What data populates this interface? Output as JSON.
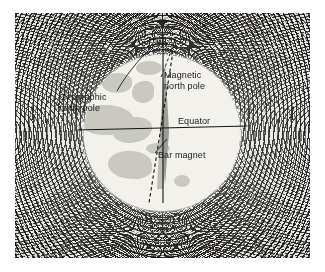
{
  "figure": {
    "kind": "photograph-diagram",
    "labels": {
      "geographic_north_pole": "Geographic\nnorth pole",
      "magnetic_north_pole": "Magnetic\nnorth pole",
      "equator": "Equator",
      "bar_magnet": "Bar magnet"
    },
    "colors": {
      "plate_background": "#e8e8e6",
      "filings": "#1a1715",
      "globe_fill": "#f2f1ec",
      "land_fill": "#c9c9c2",
      "line": "#1a1a1a",
      "bar_magnet": "#9a9a94",
      "page_background": "#ffffff"
    },
    "elements": {
      "rotation_axis": "solid vertical line through geographic poles",
      "magnetic_axis": "dashed line tilted from the rotation axis",
      "equator_line": "horizontal solid line through globe centre",
      "bar_magnet_shape": "grey spindle along the magnetic axis",
      "field_pattern": "iron filings forming closed loops from pole to pole"
    }
  }
}
